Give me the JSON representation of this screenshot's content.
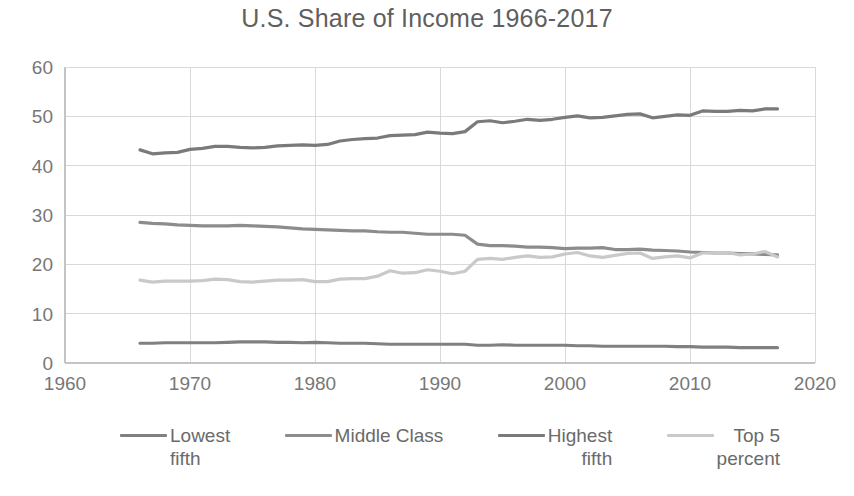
{
  "chart_data": {
    "type": "line",
    "title": "U.S. Share of Income 1966-2017",
    "xlabel": "",
    "ylabel": "",
    "xlim": [
      1960,
      2020
    ],
    "ylim": [
      0,
      60
    ],
    "xticks": [
      1960,
      1970,
      1980,
      1990,
      2000,
      2010,
      2020
    ],
    "yticks": [
      0,
      10,
      20,
      30,
      40,
      50,
      60
    ],
    "grid": true,
    "legend_position": "bottom",
    "x": [
      1966,
      1967,
      1968,
      1969,
      1970,
      1971,
      1972,
      1973,
      1974,
      1975,
      1976,
      1977,
      1978,
      1979,
      1980,
      1981,
      1982,
      1983,
      1984,
      1985,
      1986,
      1987,
      1988,
      1989,
      1990,
      1991,
      1992,
      1993,
      1994,
      1995,
      1996,
      1997,
      1998,
      1999,
      2000,
      2001,
      2002,
      2003,
      2004,
      2005,
      2006,
      2007,
      2008,
      2009,
      2010,
      2011,
      2012,
      2013,
      2014,
      2015,
      2016,
      2017
    ],
    "series": [
      {
        "name": "Lowest fifth",
        "color": "#808080",
        "values": [
          4.0,
          4.0,
          4.1,
          4.1,
          4.1,
          4.1,
          4.1,
          4.2,
          4.3,
          4.3,
          4.3,
          4.2,
          4.2,
          4.1,
          4.2,
          4.1,
          4.0,
          4.0,
          4.0,
          3.9,
          3.8,
          3.8,
          3.8,
          3.8,
          3.8,
          3.8,
          3.8,
          3.6,
          3.6,
          3.7,
          3.6,
          3.6,
          3.6,
          3.6,
          3.6,
          3.5,
          3.5,
          3.4,
          3.4,
          3.4,
          3.4,
          3.4,
          3.4,
          3.3,
          3.3,
          3.2,
          3.2,
          3.2,
          3.1,
          3.1,
          3.1,
          3.1
        ]
      },
      {
        "name": "Middle Class",
        "color": "#8c8c8c",
        "values": [
          28.5,
          28.3,
          28.2,
          28.0,
          27.9,
          27.8,
          27.8,
          27.8,
          27.9,
          27.8,
          27.7,
          27.6,
          27.4,
          27.2,
          27.1,
          27.0,
          26.9,
          26.8,
          26.8,
          26.6,
          26.5,
          26.5,
          26.3,
          26.1,
          26.1,
          26.1,
          25.9,
          24.1,
          23.8,
          23.8,
          23.7,
          23.5,
          23.5,
          23.4,
          23.2,
          23.3,
          23.3,
          23.4,
          23.0,
          23.0,
          23.1,
          22.9,
          22.8,
          22.7,
          22.5,
          22.4,
          22.3,
          22.3,
          22.2,
          22.1,
          22.0,
          21.9
        ]
      },
      {
        "name": "Highest fifth",
        "color": "#7a7a7a",
        "values": [
          43.2,
          42.4,
          42.6,
          42.7,
          43.3,
          43.5,
          43.9,
          43.9,
          43.7,
          43.6,
          43.7,
          44.0,
          44.1,
          44.2,
          44.1,
          44.3,
          45.0,
          45.3,
          45.5,
          45.6,
          46.1,
          46.2,
          46.3,
          46.8,
          46.6,
          46.5,
          46.9,
          48.9,
          49.1,
          48.7,
          49.0,
          49.4,
          49.2,
          49.4,
          49.8,
          50.1,
          49.7,
          49.8,
          50.1,
          50.4,
          50.5,
          49.7,
          50.0,
          50.3,
          50.2,
          51.1,
          51.0,
          51.0,
          51.2,
          51.1,
          51.5,
          51.5
        ]
      },
      {
        "name": "Top 5 percent",
        "color": "#c9c9c9",
        "values": [
          16.8,
          16.4,
          16.6,
          16.6,
          16.6,
          16.7,
          17.0,
          16.9,
          16.5,
          16.4,
          16.6,
          16.8,
          16.8,
          16.9,
          16.5,
          16.5,
          17.0,
          17.1,
          17.1,
          17.6,
          18.7,
          18.2,
          18.3,
          18.9,
          18.6,
          18.1,
          18.6,
          21.0,
          21.2,
          21.0,
          21.4,
          21.7,
          21.4,
          21.5,
          22.1,
          22.4,
          21.7,
          21.4,
          21.8,
          22.2,
          22.3,
          21.2,
          21.5,
          21.7,
          21.3,
          22.3,
          22.3,
          22.4,
          21.9,
          22.1,
          22.6,
          21.5
        ]
      }
    ]
  },
  "legend": {
    "items": [
      {
        "label_line1": "Lowest",
        "label_line2": "fifth",
        "color": "#808080"
      },
      {
        "label_line1": "Middle  Class",
        "label_line2": "",
        "color": "#8c8c8c"
      },
      {
        "label_line1": "Highest",
        "label_line2": "fifth",
        "color": "#7a7a7a"
      },
      {
        "label_line1": "Top 5",
        "label_line2": "percent",
        "color": "#c9c9c9"
      }
    ]
  }
}
